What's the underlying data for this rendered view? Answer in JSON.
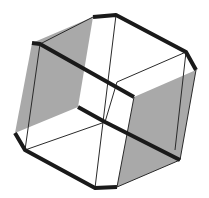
{
  "diagram": {
    "colors": {
      "background": "#ffffff",
      "face_fill": "#a9a9a9",
      "thick_edge": "#1a1a1a",
      "thin_edge": "#2a2a2a"
    },
    "shaded_faces": [
      {
        "name": "left-face",
        "points": "32,43 93,17 78,107 15,133"
      },
      {
        "name": "right-face",
        "points": "134,97 196,70 180,160 117,187"
      }
    ],
    "thick_edges": [
      {
        "name": "top-front-edge",
        "points": "32,43 40,44 134,97"
      },
      {
        "name": "top-back-edge",
        "points": "93,17 116,15 186,52 196,70"
      },
      {
        "name": "middle-edge",
        "points": "78,107 105,122 180,160"
      },
      {
        "name": "bottom-left-edge",
        "points": "15,133 25,150 95,188 117,187"
      }
    ],
    "thin_edges": [
      {
        "name": "thin-1",
        "points": "40,44 25,150"
      },
      {
        "name": "thin-2",
        "points": "116,15 95,188"
      },
      {
        "name": "thin-3",
        "points": "186,52 117,82"
      },
      {
        "name": "thin-4",
        "points": "93,17 40,44"
      },
      {
        "name": "thin-5",
        "points": "105,122 25,150"
      },
      {
        "name": "thin-6",
        "points": "134,97 117,187"
      },
      {
        "name": "thin-7",
        "points": "196,70 180,160"
      },
      {
        "name": "thin-8",
        "points": "180,160 117,187"
      },
      {
        "name": "thin-9",
        "points": "117,82 105,122"
      },
      {
        "name": "thin-10",
        "points": "186,52 175,150"
      }
    ]
  }
}
